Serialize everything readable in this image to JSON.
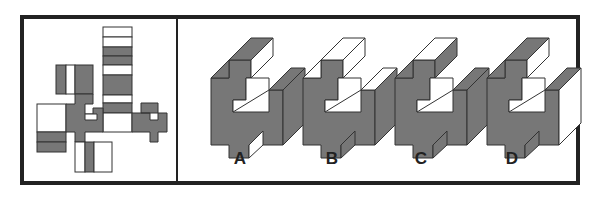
{
  "puzzle": {
    "type": "cube-net-folding",
    "net_panel": "unfolded net",
    "options_panel": "folded candidates",
    "options": [
      {
        "label": "A",
        "x": 230
      },
      {
        "label": "B",
        "x": 322
      },
      {
        "label": "C",
        "x": 411
      },
      {
        "label": "D",
        "x": 502
      }
    ]
  },
  "colors": {
    "frame": "#222222",
    "shade": "#777777",
    "light": "#ffffff",
    "stroke": "#333333"
  }
}
